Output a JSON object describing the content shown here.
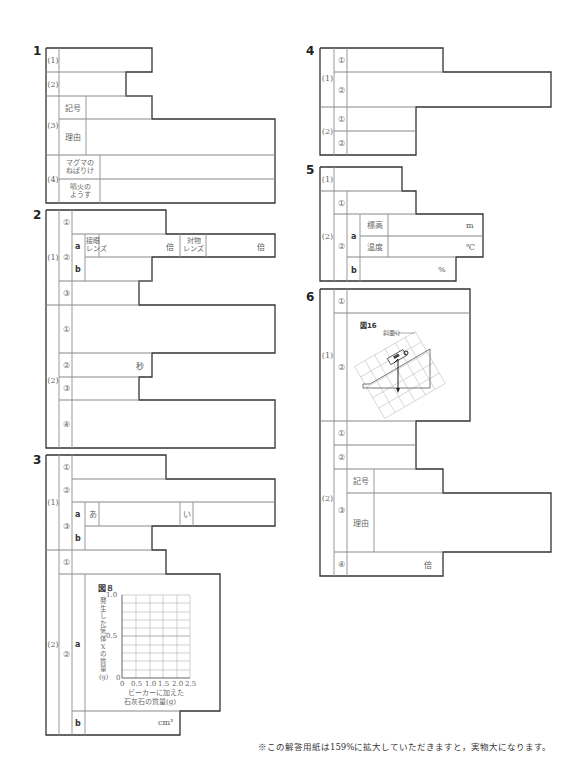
{
  "sections": [
    {
      "number": "1",
      "rows": [
        {
          "label": "(1)"
        },
        {
          "label": "(2)"
        },
        {
          "label": "(3)",
          "sub": [
            {
              "label": "記号"
            },
            {
              "label": "理由"
            }
          ]
        },
        {
          "label": "(4)",
          "sub": [
            {
              "label": "マグマの\nねばりけ"
            },
            {
              "label": "噴火の\nようす"
            }
          ]
        }
      ]
    },
    {
      "number": "2",
      "rows": [
        {
          "label": "(1)",
          "sub": [
            {
              "label": "①"
            },
            {
              "label": "②",
              "parts": [
                {
                  "label": "a",
                  "fields": [
                    {
                      "name": "接眼\nレンズ",
                      "unit": "倍"
                    },
                    {
                      "name": "対物\nレンズ",
                      "unit": "倍"
                    }
                  ]
                },
                {
                  "label": "b"
                }
              ]
            },
            {
              "label": "③"
            }
          ]
        },
        {
          "label": "(2)",
          "sub": [
            {
              "label": "①"
            },
            {
              "label": "②",
              "unit": "秒"
            },
            {
              "label": "③"
            },
            {
              "label": "④"
            }
          ]
        }
      ]
    },
    {
      "number": "3",
      "rows": [
        {
          "label": "(1)",
          "sub": [
            {
              "label": "①"
            },
            {
              "label": "②"
            },
            {
              "label": "③",
              "parts": [
                {
                  "label": "a",
                  "fields": [
                    {
                      "name": "あ"
                    },
                    {
                      "name": "い"
                    }
                  ]
                },
                {
                  "label": "b"
                }
              ]
            }
          ]
        },
        {
          "label": "(2)",
          "sub": [
            {
              "label": "①"
            },
            {
              "label": "②",
              "parts": [
                {
                  "label": "a"
                },
                {
                  "label": "b",
                  "unit": "cm³"
                }
              ]
            }
          ]
        }
      ]
    },
    {
      "number": "4",
      "rows": [
        {
          "label": "(1)",
          "sub": [
            {
              "label": "①"
            },
            {
              "label": "②"
            }
          ]
        },
        {
          "label": "(2)",
          "sub": [
            {
              "label": "①"
            },
            {
              "label": "②"
            }
          ]
        }
      ]
    },
    {
      "number": "5",
      "rows": [
        {
          "label": "(1)"
        },
        {
          "label": "(2)",
          "sub": [
            {
              "label": "①"
            },
            {
              "label": "②",
              "parts": [
                {
                  "label": "a",
                  "fields": [
                    {
                      "name": "標高",
                      "unit": "m"
                    },
                    {
                      "name": "温度",
                      "unit": "℃"
                    }
                  ]
                },
                {
                  "label": "b",
                  "unit": "%"
                }
              ]
            }
          ]
        }
      ]
    },
    {
      "number": "6",
      "rows": [
        {
          "label": "(1)",
          "sub": [
            {
              "label": "①"
            },
            {
              "label": "②"
            }
          ]
        },
        {
          "label": "(2)",
          "sub": [
            {
              "label": "①"
            },
            {
              "label": "②"
            },
            {
              "label": "③",
              "parts": [
                {
                  "label": "記号"
                },
                {
                  "label": "理由"
                }
              ]
            },
            {
              "label": "④",
              "unit": "倍"
            }
          ]
        }
      ]
    }
  ],
  "figure8": {
    "title": "図８",
    "ylabel": "発生した気体Xの質量(g)",
    "xlabel_line1": "ビーカーに加えた",
    "xlabel_line2": "石灰石の質量(g)",
    "yticks": [
      "1.0",
      "0.5",
      "0"
    ],
    "xticks": [
      "0",
      "0.5",
      "1.0",
      "1.5",
      "2.0",
      "2.5"
    ]
  },
  "figure16": {
    "title": "図16",
    "label": "斜面Q"
  },
  "footnote": "※この解答用紙は159%に拡大していただきますと，実物大になります。"
}
